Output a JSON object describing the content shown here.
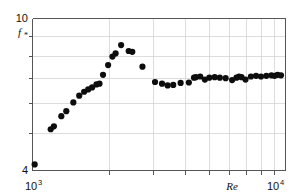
{
  "figure": {
    "background_color": "#ffffff",
    "marker_color": "#0d0d0d",
    "frame_color": "#555555",
    "grid_color": "#cfcfcf"
  },
  "labels": {
    "y_axis_top": "10",
    "y_axis_bottom": "4",
    "y_axis_symbol": "f",
    "y_axis_symbol_sub": "*",
    "x_axis_left_base": "10",
    "x_axis_left_exp": "3",
    "x_axis_right_base": "10",
    "x_axis_right_exp": "4",
    "x_axis_name": "Re"
  },
  "chart_data": {
    "type": "scatter",
    "title": "",
    "xlabel": "Re",
    "ylabel": "f*",
    "xscale": "log",
    "yscale": "log",
    "xlim": [
      1000,
      10000
    ],
    "ylim": [
      4,
      10
    ],
    "grid": true,
    "legend": null,
    "xticks": [
      1000,
      10000
    ],
    "xticklabels": [
      "10^3",
      "10^4"
    ],
    "xminorticks": [
      2000,
      3000,
      4000,
      5000,
      6000,
      7000,
      8000,
      9000
    ],
    "yticks": [
      4,
      10
    ],
    "yticklabels": [
      "4",
      "10"
    ],
    "ygridvalues": [
      5,
      6,
      7,
      8,
      9
    ],
    "marker": "filled-circle",
    "marker_size_px": 3.1,
    "points": [
      {
        "x": 1020,
        "y": 4.15
      },
      {
        "x": 1180,
        "y": 5.13
      },
      {
        "x": 1215,
        "y": 5.22
      },
      {
        "x": 1300,
        "y": 5.55
      },
      {
        "x": 1360,
        "y": 5.72
      },
      {
        "x": 1450,
        "y": 6.03
      },
      {
        "x": 1530,
        "y": 6.28
      },
      {
        "x": 1600,
        "y": 6.43
      },
      {
        "x": 1660,
        "y": 6.52
      },
      {
        "x": 1720,
        "y": 6.6
      },
      {
        "x": 1790,
        "y": 6.72
      },
      {
        "x": 1840,
        "y": 6.75
      },
      {
        "x": 1900,
        "y": 7.12
      },
      {
        "x": 1990,
        "y": 7.55
      },
      {
        "x": 2070,
        "y": 7.95
      },
      {
        "x": 2130,
        "y": 8.1
      },
      {
        "x": 2240,
        "y": 8.52
      },
      {
        "x": 2400,
        "y": 8.22
      },
      {
        "x": 2480,
        "y": 8.18
      },
      {
        "x": 2720,
        "y": 7.48
      },
      {
        "x": 3050,
        "y": 6.82
      },
      {
        "x": 3250,
        "y": 6.75
      },
      {
        "x": 3420,
        "y": 6.68
      },
      {
        "x": 3600,
        "y": 6.7
      },
      {
        "x": 3850,
        "y": 6.78
      },
      {
        "x": 4150,
        "y": 6.8
      },
      {
        "x": 4350,
        "y": 7.0
      },
      {
        "x": 4420,
        "y": 7.02
      },
      {
        "x": 4600,
        "y": 7.05
      },
      {
        "x": 4800,
        "y": 6.92
      },
      {
        "x": 5000,
        "y": 7.0
      },
      {
        "x": 5250,
        "y": 7.02
      },
      {
        "x": 5500,
        "y": 7.0
      },
      {
        "x": 5800,
        "y": 6.98
      },
      {
        "x": 6150,
        "y": 6.9
      },
      {
        "x": 6400,
        "y": 7.0
      },
      {
        "x": 6550,
        "y": 7.05
      },
      {
        "x": 6700,
        "y": 7.02
      },
      {
        "x": 6950,
        "y": 6.92
      },
      {
        "x": 7300,
        "y": 7.05
      },
      {
        "x": 7650,
        "y": 7.08
      },
      {
        "x": 8000,
        "y": 7.05
      },
      {
        "x": 8400,
        "y": 7.08
      },
      {
        "x": 8800,
        "y": 7.1
      },
      {
        "x": 9050,
        "y": 7.08
      },
      {
        "x": 9300,
        "y": 7.12
      },
      {
        "x": 9600,
        "y": 7.1
      }
    ]
  }
}
